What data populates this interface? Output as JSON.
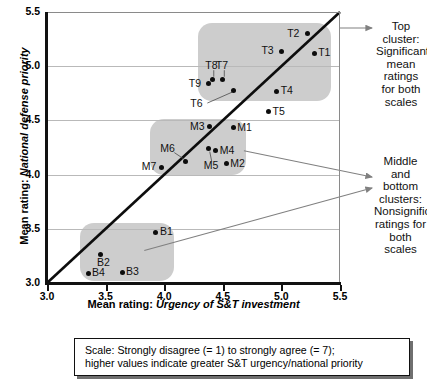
{
  "chart_data": {
    "type": "scatter",
    "title": "",
    "xlabel_prefix": "Mean rating: ",
    "xlabel_emph": "Urgency of S&T investment",
    "ylabel_prefix": "Mean rating: ",
    "ylabel_emph": "National defense priority",
    "xlim": [
      3.0,
      5.5
    ],
    "ylim": [
      3.0,
      5.5
    ],
    "xticks": [
      "3.0",
      "3.5",
      "4.0",
      "4.5",
      "5.0",
      "5.5"
    ],
    "yticks": [
      "3.0",
      "3.5",
      "4.0",
      "4.5",
      "5.0",
      "5.5"
    ],
    "xtick_values": [
      3.0,
      3.5,
      4.0,
      4.5,
      5.0,
      5.5
    ],
    "ytick_values": [
      3.0,
      3.5,
      4.0,
      4.5,
      5.0,
      5.5
    ],
    "grid": "horizontal",
    "legend": "none",
    "reference_line": {
      "name": "identity-line",
      "from": [
        3.0,
        3.0
      ],
      "to": [
        5.5,
        5.5
      ]
    },
    "points": [
      {
        "label": "T1",
        "x": 5.28,
        "y": 5.12,
        "lab_pos": "right"
      },
      {
        "label": "T2",
        "x": 5.22,
        "y": 5.3,
        "lab_pos": "left"
      },
      {
        "label": "T3",
        "x": 5.0,
        "y": 5.14,
        "lab_pos": "left"
      },
      {
        "label": "T4",
        "x": 4.96,
        "y": 4.77,
        "lab_pos": "right"
      },
      {
        "label": "T5",
        "x": 4.89,
        "y": 4.58,
        "lab_pos": "right"
      },
      {
        "label": "T6",
        "x": 4.59,
        "y": 4.78,
        "lab_pos": "leader-left"
      },
      {
        "label": "T7",
        "x": 4.5,
        "y": 4.88,
        "lab_pos": "leader-up"
      },
      {
        "label": "T8",
        "x": 4.41,
        "y": 4.88,
        "lab_pos": "leader-up"
      },
      {
        "label": "T9",
        "x": 4.38,
        "y": 4.84,
        "lab_pos": "left"
      },
      {
        "label": "M1",
        "x": 4.59,
        "y": 4.43,
        "lab_pos": "right"
      },
      {
        "label": "M2",
        "x": 4.53,
        "y": 4.1,
        "lab_pos": "right"
      },
      {
        "label": "M3",
        "x": 4.39,
        "y": 4.44,
        "lab_pos": "left"
      },
      {
        "label": "M4",
        "x": 4.44,
        "y": 4.22,
        "lab_pos": "right"
      },
      {
        "label": "M5",
        "x": 4.38,
        "y": 4.24,
        "lab_pos": "leader-down"
      },
      {
        "label": "M6",
        "x": 4.18,
        "y": 4.12,
        "lab_pos": "leader-upleft"
      },
      {
        "label": "M7",
        "x": 3.98,
        "y": 4.07,
        "lab_pos": "left"
      },
      {
        "label": "B1",
        "x": 3.93,
        "y": 3.47,
        "lab_pos": "right"
      },
      {
        "label": "B2",
        "x": 3.46,
        "y": 3.26,
        "lab_pos": "below"
      },
      {
        "label": "B3",
        "x": 3.64,
        "y": 3.1,
        "lab_pos": "right"
      },
      {
        "label": "B4",
        "x": 3.35,
        "y": 3.09,
        "lab_pos": "right"
      }
    ],
    "clusters": [
      {
        "name": "top-cluster",
        "x0": 4.29,
        "y0": 5.4,
        "x1": 5.42,
        "y1": 4.68
      },
      {
        "name": "middle-cluster",
        "x0": 3.88,
        "y0": 4.51,
        "x1": 4.7,
        "y1": 4.0
      },
      {
        "name": "bottom-cluster",
        "x0": 3.28,
        "y0": 3.55,
        "x1": 4.08,
        "y1": 3.02
      }
    ],
    "annotations": [
      {
        "name": "top-cluster-annotation",
        "text": "Top cluster:\nSignificant\nmean ratings\nfor both\nscales",
        "target_cluster": "top-cluster"
      },
      {
        "name": "middle-bottom-cluster-annotation",
        "text": "Middle and\nbottom\nclusters:\nNonsignificant\nratings for\nboth scales",
        "target_cluster": "middle-cluster"
      }
    ],
    "caption": "Scale: Strongly disagree (= 1) to strongly agree (= 7);\nhigher values indicate greater S&T urgency/national priority",
    "colors": {
      "cluster_fill": "#cdcdcd",
      "point": "#0c0c0c",
      "axis": "#111111",
      "grid": "#b9b9b9",
      "arrow": "#808080",
      "background": "#ffffff"
    }
  }
}
